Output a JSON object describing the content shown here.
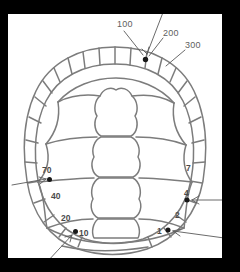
{
  "figure": {
    "background_color": "#000000",
    "canvas_color": "#ffffff",
    "line_color": "#7c7c7c",
    "label_color": "#5e5e5e",
    "marker_color": "#151515"
  },
  "canvas": {
    "x": 8,
    "y": 14,
    "width": 214,
    "height": 244
  },
  "reference_labels": [
    {
      "id": "ref-100",
      "text": "100",
      "x": 117,
      "y": 24,
      "leader": {
        "x1": 124,
        "y1": 29,
        "x2": 144,
        "y2": 56
      }
    },
    {
      "id": "ref-200",
      "text": "200",
      "x": 164,
      "y": 33,
      "leader": {
        "x1": 163,
        "y1": 37,
        "x2": 148,
        "y2": 57
      }
    },
    {
      "id": "ref-300",
      "text": "300",
      "x": 186,
      "y": 45,
      "leader": {
        "x1": 185,
        "y1": 49,
        "x2": 165,
        "y2": 65
      }
    },
    {
      "id": "ref-unlabeled-top",
      "text": "",
      "x": 0,
      "y": 0,
      "leader": {
        "x1": 166,
        "y1": 3,
        "x2": 147,
        "y2": 56
      }
    }
  ],
  "scute_labels": {
    "left": [
      {
        "id": "scute-70",
        "text": "70",
        "x": 45,
        "y": 170
      },
      {
        "id": "scute-40",
        "text": "40",
        "x": 54,
        "y": 196
      },
      {
        "id": "scute-20",
        "text": "20",
        "x": 64,
        "y": 218
      },
      {
        "id": "scute-10",
        "text": "10",
        "x": 82,
        "y": 233
      }
    ],
    "right": [
      {
        "id": "scute-7",
        "text": "7",
        "x": 188,
        "y": 168
      },
      {
        "id": "scute-4",
        "text": "4",
        "x": 186,
        "y": 193
      },
      {
        "id": "scute-2",
        "text": "2",
        "x": 177,
        "y": 215
      },
      {
        "id": "scute-1",
        "text": "1",
        "x": 159,
        "y": 232
      }
    ]
  },
  "markers": [
    {
      "id": "marker-top",
      "x": 145.5,
      "y": 59.5,
      "r": 2.6
    },
    {
      "id": "marker-left-70",
      "x": 49.5,
      "y": 179.5,
      "r": 2.6
    },
    {
      "id": "marker-left-10",
      "x": 75.5,
      "y": 231.5,
      "r": 2.6
    },
    {
      "id": "marker-right-4",
      "x": 187.0,
      "y": 200.0,
      "r": 2.6
    },
    {
      "id": "marker-right-1",
      "x": 168.0,
      "y": 230.0,
      "r": 2.6
    }
  ],
  "arrows": [
    {
      "id": "arrow-top",
      "x1": 166,
      "y1": 3,
      "x2": 147,
      "y2": 56
    },
    {
      "id": "arrow-left-upper",
      "x1": 12,
      "y1": 184,
      "x2": 47,
      "y2": 180
    },
    {
      "id": "arrow-left-lower",
      "x1": 48,
      "y1": 260,
      "x2": 73,
      "y2": 234
    },
    {
      "id": "arrow-right-mid",
      "x1": 238,
      "y1": 200,
      "x2": 192,
      "y2": 200
    },
    {
      "id": "arrow-right-lower",
      "x1": 238,
      "y1": 238,
      "x2": 172,
      "y2": 231
    }
  ],
  "shell": {
    "description": "Oval carapace outline with ring of marginal scutes, five central vertebral scutes and four pairs of costal scutes",
    "outer_outline": "M115,47 C150,47 180,62 194,90 C206,115 208,148 203,180 C197,212 178,238 148,248 C125,255 100,255 78,248 C49,238 32,212 27,180 C22,148 24,115 36,90 C50,62 80,47 115,47 Z",
    "inner_outline": "M115,63 C146,63 172,76 184,100 C195,122 197,152 192,180 C187,208 170,230 144,239 C124,245 103,245 84,239 C58,230 42,208 37,180 C32,152 34,122 45,100 C57,76 84,63 115,63 Z",
    "vertebral_scutes": 5,
    "costal_scutes_per_side": 4,
    "marginal_scutes_per_side": 12
  }
}
